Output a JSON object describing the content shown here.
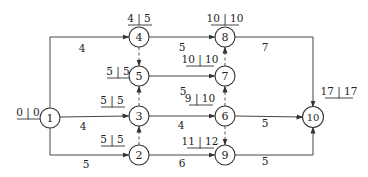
{
  "diagram": {
    "type": "activity-on-arrow network",
    "nodes": [
      {
        "id": "1",
        "label": "1",
        "x": 50,
        "y": 118,
        "times": "0|0",
        "es": "0",
        "ls": "0"
      },
      {
        "id": "2",
        "label": "2",
        "x": 139,
        "y": 155,
        "times": "5|5",
        "es": "5",
        "ls": "5"
      },
      {
        "id": "3",
        "label": "3",
        "x": 139,
        "y": 116,
        "times": "5|5",
        "es": "5",
        "ls": "5"
      },
      {
        "id": "4",
        "label": "4",
        "x": 139,
        "y": 37,
        "times": "4|5",
        "es": "4",
        "ls": "5"
      },
      {
        "id": "5",
        "label": "5",
        "x": 139,
        "y": 76,
        "times": "5|5",
        "es": "5",
        "ls": "5"
      },
      {
        "id": "6",
        "label": "6",
        "x": 225,
        "y": 116,
        "times": "9|10",
        "es": "9",
        "ls": "10"
      },
      {
        "id": "7",
        "label": "7",
        "x": 225,
        "y": 76,
        "times": "10|10",
        "es": "10",
        "ls": "10"
      },
      {
        "id": "8",
        "label": "8",
        "x": 225,
        "y": 37,
        "times": "10|10",
        "es": "10",
        "ls": "10"
      },
      {
        "id": "9",
        "label": "9",
        "x": 225,
        "y": 155,
        "times": "11|12",
        "es": "11",
        "ls": "12"
      },
      {
        "id": "10",
        "label": "10",
        "x": 313,
        "y": 117,
        "times": "17|17",
        "es": "17",
        "ls": "17"
      }
    ],
    "edges": [
      {
        "from": "1",
        "to": "4",
        "duration": "4",
        "dummy": false
      },
      {
        "from": "1",
        "to": "3",
        "duration": "4",
        "dummy": false
      },
      {
        "from": "1",
        "to": "2",
        "duration": "5",
        "dummy": false
      },
      {
        "from": "4",
        "to": "8",
        "duration": "5",
        "dummy": false
      },
      {
        "from": "5",
        "to": "7",
        "duration": "5",
        "dummy": false
      },
      {
        "from": "3",
        "to": "6",
        "duration": "4",
        "dummy": false
      },
      {
        "from": "2",
        "to": "9",
        "duration": "6",
        "dummy": false
      },
      {
        "from": "8",
        "to": "10",
        "duration": "7",
        "dummy": false
      },
      {
        "from": "6",
        "to": "10",
        "duration": "5",
        "dummy": false
      },
      {
        "from": "9",
        "to": "10",
        "duration": "5",
        "dummy": false
      },
      {
        "from": "4",
        "to": "5",
        "duration": "",
        "dummy": true
      },
      {
        "from": "3",
        "to": "5",
        "duration": "",
        "dummy": true
      },
      {
        "from": "2",
        "to": "3",
        "duration": "",
        "dummy": true
      },
      {
        "from": "7",
        "to": "8",
        "duration": "",
        "dummy": true
      },
      {
        "from": "6",
        "to": "7",
        "duration": "",
        "dummy": true
      },
      {
        "from": "6",
        "to": "9",
        "duration": "",
        "dummy": true
      }
    ]
  },
  "labels": {
    "n1": "1",
    "n2": "2",
    "n3": "3",
    "n4": "4",
    "n5": "5",
    "n6": "6",
    "n7": "7",
    "n8": "8",
    "n9": "9",
    "n10": "10",
    "t1": "0 | 0",
    "t2": "5 | 5",
    "t3": "5 | 5",
    "t4": "4 | 5",
    "t5": "5 | 5",
    "t6": "9 | 10",
    "t7": "10 | 10",
    "t8": "10 | 10",
    "t9": "11 | 12",
    "t10": "17 | 17",
    "d_1_4": "4",
    "d_1_3": "4",
    "d_1_2": "5",
    "d_4_8": "5",
    "d_5_7": "5",
    "d_3_6": "4",
    "d_2_9": "6",
    "d_8_10": "7",
    "d_6_10": "5",
    "d_9_10": "5"
  }
}
